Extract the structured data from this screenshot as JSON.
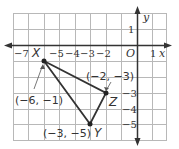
{
  "diagram": {
    "type": "coordinate-plane-triangle",
    "axes": {
      "x_label": "x",
      "y_label": "y",
      "origin_label": "O",
      "x_ticks": [
        {
          "value": -7,
          "label": "−7"
        },
        {
          "value": -5,
          "label": "−5"
        },
        {
          "value": -4,
          "label": "−4"
        },
        {
          "value": -3,
          "label": "−3"
        },
        {
          "value": -2,
          "label": "−2"
        },
        {
          "value": 1,
          "label": "1"
        }
      ],
      "y_ticks": [
        {
          "value": 1,
          "label": "1"
        },
        {
          "value": -3,
          "label": "−3"
        },
        {
          "value": -4,
          "label": "−4"
        },
        {
          "value": -5,
          "label": "−5"
        }
      ],
      "x_range": [
        -8,
        2
      ],
      "y_range": [
        -6,
        2
      ],
      "grid": true
    },
    "vertices": [
      {
        "name": "X",
        "x": -6,
        "y": -1,
        "coord_label": "(−6, −1)"
      },
      {
        "name": "Z",
        "x": -2,
        "y": -3,
        "coord_label": "(−2, −3)"
      },
      {
        "name": "Y",
        "x": -3,
        "y": -5,
        "coord_label": "(−3, −5)"
      }
    ],
    "colors": {
      "grid": "#b8b8b8",
      "axis": "#333333",
      "triangle": "#333333",
      "background": "#ffffff"
    }
  }
}
